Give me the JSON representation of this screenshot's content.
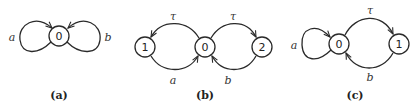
{
  "diagrams": [
    {
      "caption": "(a)",
      "nodes": [
        {
          "id": "0",
          "label": "0"
        }
      ],
      "edges": [
        {
          "from": "0",
          "to": "0",
          "label": "a",
          "kind": "self-loop-left"
        },
        {
          "from": "0",
          "to": "0",
          "label": "b",
          "kind": "self-loop-right"
        }
      ]
    },
    {
      "caption": "(b)",
      "nodes": [
        {
          "id": "1",
          "label": "1"
        },
        {
          "id": "0",
          "label": "0"
        },
        {
          "id": "2",
          "label": "2"
        }
      ],
      "edges": [
        {
          "from": "0",
          "to": "1",
          "label": "τ"
        },
        {
          "from": "1",
          "to": "0",
          "label": "a"
        },
        {
          "from": "0",
          "to": "2",
          "label": "τ"
        },
        {
          "from": "2",
          "to": "0",
          "label": "b"
        }
      ]
    },
    {
      "caption": "(c)",
      "nodes": [
        {
          "id": "0",
          "label": "0"
        },
        {
          "id": "1",
          "label": "1"
        }
      ],
      "edges": [
        {
          "from": "0",
          "to": "0",
          "label": "a",
          "kind": "self-loop-left"
        },
        {
          "from": "0",
          "to": "1",
          "label": "τ"
        },
        {
          "from": "1",
          "to": "0",
          "label": "b"
        }
      ]
    }
  ]
}
